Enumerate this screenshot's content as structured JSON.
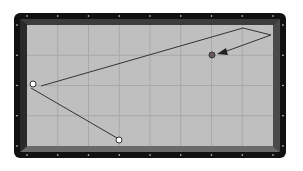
{
  "diagram": {
    "type": "three-cushion billiards shot diagram",
    "table": {
      "frame_color": "#111111",
      "cushion_color": "#5e5e5e",
      "cloth_color": "#bfbfbf",
      "grid_color": "#a9a9a9",
      "diamond_color": "#e8e8e8",
      "columns": 8,
      "rows": 4
    },
    "balls": [
      {
        "id": "cue-ball",
        "label": "white ball (left rail)",
        "x": 33,
        "y": 84,
        "fill": "#ffffff"
      },
      {
        "id": "object-ball-1",
        "label": "white ball (bottom rail)",
        "x": 119,
        "y": 140,
        "fill": "#ffffff"
      },
      {
        "id": "object-ball-2",
        "label": "red ball",
        "x": 212,
        "y": 55,
        "fill": "#6a5a5a"
      }
    ],
    "path": {
      "color": "#333333",
      "segments": [
        {
          "from": [
            31,
            88
          ],
          "to": [
            117,
            138
          ]
        },
        {
          "from": [
            41,
            86
          ],
          "to": [
            243,
            28
          ]
        },
        {
          "from": [
            243,
            28
          ],
          "to": [
            271,
            35
          ]
        },
        {
          "from": [
            271,
            35
          ],
          "to": [
            224,
            52
          ]
        }
      ],
      "arrow_tip": [
        218,
        54
      ]
    }
  }
}
